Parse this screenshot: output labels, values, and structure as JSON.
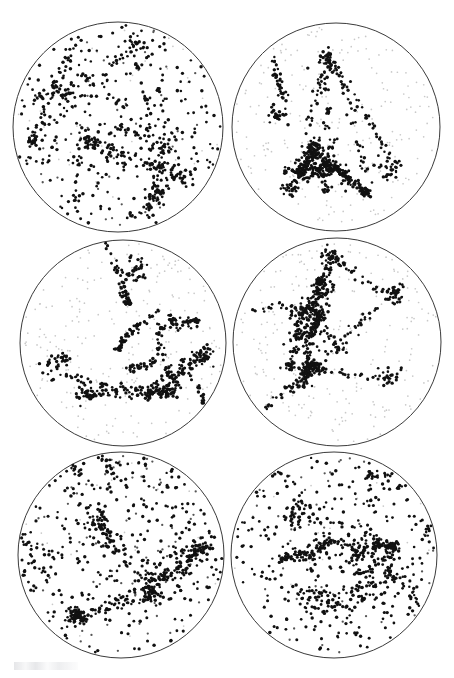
{
  "figure": {
    "title": "Six-panel circular sky projections of point distributions",
    "background_color": "#ffffff",
    "outline_color": "#3a3a3a",
    "outline_width": 1,
    "width": 454,
    "height": 678,
    "rows": 3,
    "columns": 2,
    "panel_count": 6
  },
  "markers": {
    "dark_color": "#111111",
    "mid_color": "#555555",
    "faint_color": "#c9c9c9",
    "dark_radius": 1.45,
    "mid_radius": 1.15,
    "faint_radius": 0.85
  },
  "artifact": {
    "name": "scan-smudge",
    "label": "faint scan smudge",
    "x": 14,
    "y": 662,
    "width": 64,
    "height": 8
  },
  "chart_data": {
    "type": "scatter",
    "title": "Six-panel circular sky projections of point distributions",
    "xlabel": "",
    "ylabel": "",
    "grid": false,
    "legend": null,
    "panels": [
      {
        "id": "panel-1",
        "label": "top-left",
        "row": 0,
        "column": 0,
        "center_x": 118,
        "center_y": 127,
        "radius": 105,
        "n_points": 760,
        "faint_fraction": 0.04,
        "n_filaments": 16,
        "filament_fraction": 0.46,
        "n_clusters": 7,
        "cluster_fraction": 0.12,
        "cluster_sigma": 5.5,
        "filament_sigma": 2.6,
        "density_gradient": 0.18,
        "gradient_angle_deg": 70,
        "seed": 10411
      },
      {
        "id": "panel-2",
        "label": "top-right",
        "row": 0,
        "column": 1,
        "center_x": 336,
        "center_y": 127,
        "radius": 104,
        "n_points": 900,
        "faint_fraction": 0.42,
        "n_filaments": 13,
        "filament_fraction": 0.52,
        "n_clusters": 9,
        "cluster_fraction": 0.24,
        "cluster_sigma": 4.2,
        "filament_sigma": 2.2,
        "density_gradient": 0.12,
        "gradient_angle_deg": 20,
        "seed": 20717
      },
      {
        "id": "panel-3",
        "label": "middle-left",
        "row": 1,
        "column": 0,
        "center_x": 123,
        "center_y": 343,
        "radius": 103,
        "n_points": 860,
        "faint_fraction": 0.46,
        "n_filaments": 12,
        "filament_fraction": 0.5,
        "n_clusters": 8,
        "cluster_fraction": 0.22,
        "cluster_sigma": 4.4,
        "filament_sigma": 2.2,
        "density_gradient": 0.22,
        "gradient_angle_deg": 105,
        "seed": 30823
      },
      {
        "id": "panel-4",
        "label": "middle-right",
        "row": 1,
        "column": 1,
        "center_x": 337,
        "center_y": 342,
        "radius": 104,
        "n_points": 940,
        "faint_fraction": 0.38,
        "n_filaments": 15,
        "filament_fraction": 0.54,
        "n_clusters": 10,
        "cluster_fraction": 0.22,
        "cluster_sigma": 4.0,
        "filament_sigma": 2.3,
        "density_gradient": 0.26,
        "gradient_angle_deg": 95,
        "seed": 40937
      },
      {
        "id": "panel-5",
        "label": "bottom-left",
        "row": 2,
        "column": 0,
        "center_x": 121,
        "center_y": 555,
        "radius": 103,
        "n_points": 840,
        "faint_fraction": 0.03,
        "n_filaments": 18,
        "filament_fraction": 0.4,
        "n_clusters": 6,
        "cluster_fraction": 0.1,
        "cluster_sigma": 5.0,
        "filament_sigma": 2.8,
        "density_gradient": 0.34,
        "gradient_angle_deg": 115,
        "seed": 51049
      },
      {
        "id": "panel-6",
        "label": "bottom-right",
        "row": 2,
        "column": 1,
        "center_x": 334,
        "center_y": 555,
        "radius": 103,
        "n_points": 830,
        "faint_fraction": 0.03,
        "n_filaments": 17,
        "filament_fraction": 0.42,
        "n_clusters": 7,
        "cluster_fraction": 0.12,
        "cluster_sigma": 4.8,
        "filament_sigma": 2.7,
        "density_gradient": 0.24,
        "gradient_angle_deg": 130,
        "seed": 61151
      }
    ]
  }
}
